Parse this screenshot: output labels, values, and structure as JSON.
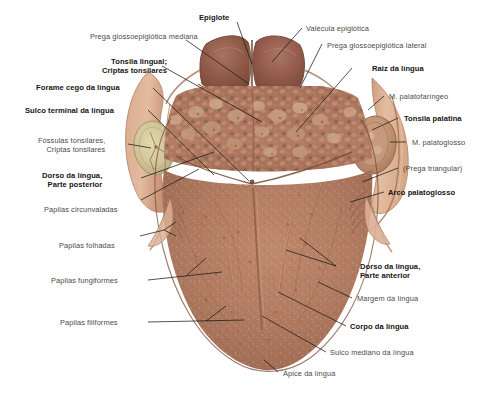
{
  "figure": {
    "background": "#ffffff",
    "palette": {
      "tongue_mid": "#b07b62",
      "tongue_dark": "#8d5a47",
      "tongue_light": "#c79a80",
      "root_dark": "#8b5747",
      "epiglottis": "#9c6450",
      "tonsil_pale": "#d8cda0",
      "mucosa_pale": "#e0b89c",
      "outline": "#6a4434",
      "leader": "#1a1a1a"
    }
  },
  "labels": [
    {
      "id": "epiglote",
      "text": "Epiglote",
      "bold": true,
      "align": "center"
    },
    {
      "id": "prega-gloss-mediana",
      "text": "Prega glossoepiglótica mediana",
      "bold": false,
      "align": "right"
    },
    {
      "id": "tonsila-lingual",
      "text": "Tonsila lingual;",
      "text2": "Criptas tonsilares",
      "bold": true,
      "align": "right"
    },
    {
      "id": "forame-cego",
      "text": "Forame cego da língua",
      "bold": true,
      "align": "right"
    },
    {
      "id": "sulco-terminal",
      "text": "Sulco terminal da língua",
      "bold": true,
      "align": "right"
    },
    {
      "id": "fossulas-tonsilares",
      "text": "Fóssulas tonsilares,",
      "text2": "Criptas tonsilares",
      "bold": false,
      "align": "right"
    },
    {
      "id": "dorso-posterior",
      "text": "Dorso da língua,",
      "text2": "Parte posterior",
      "bold": true,
      "align": "right"
    },
    {
      "id": "papilas-circunvaladas",
      "text": "Papilas circunvaladas",
      "bold": false,
      "align": "right"
    },
    {
      "id": "papilas-folhadas",
      "text": "Papilas folhadas",
      "bold": false,
      "align": "right"
    },
    {
      "id": "papilas-fungiformes",
      "text": "Papilas fungiformes",
      "bold": false,
      "align": "right"
    },
    {
      "id": "papilas-filiformes",
      "text": "Papilas filiformes",
      "bold": false,
      "align": "right"
    },
    {
      "id": "valecula",
      "text": "Valécula epiglótica",
      "bold": false,
      "align": "left"
    },
    {
      "id": "prega-gloss-lateral",
      "text": "Prega glossoepiglótica lateral",
      "bold": false,
      "align": "left"
    },
    {
      "id": "raiz-da-lingua",
      "text": "Raiz da língua",
      "bold": true,
      "align": "left"
    },
    {
      "id": "m-palatofaringeo",
      "text": "M. palatofaríngeo",
      "bold": false,
      "align": "left"
    },
    {
      "id": "tonsila-palatina",
      "text": "Tonsila palatina",
      "bold": true,
      "align": "left"
    },
    {
      "id": "m-palatoglosso",
      "text": "M. palatoglosso",
      "bold": false,
      "align": "left"
    },
    {
      "id": "prega-triangular",
      "text": "(Prega triangular)",
      "bold": false,
      "align": "left"
    },
    {
      "id": "arco-palatoglosso",
      "text": "Arco palatoglosso",
      "bold": true,
      "align": "left"
    },
    {
      "id": "dorso-anterior",
      "text": "Dorso da língua,",
      "text2": "Parte anterior",
      "bold": true,
      "align": "left"
    },
    {
      "id": "margem-da-lingua",
      "text": "Margem da língua",
      "bold": false,
      "align": "left"
    },
    {
      "id": "corpo-da-lingua",
      "text": "Corpo da língua",
      "bold": true,
      "align": "left"
    },
    {
      "id": "sulco-mediano",
      "text": "Sulco mediano da língua",
      "bold": false,
      "align": "left"
    },
    {
      "id": "apice-da-lingua",
      "text": "Ápice da língua",
      "bold": false,
      "align": "left"
    }
  ]
}
